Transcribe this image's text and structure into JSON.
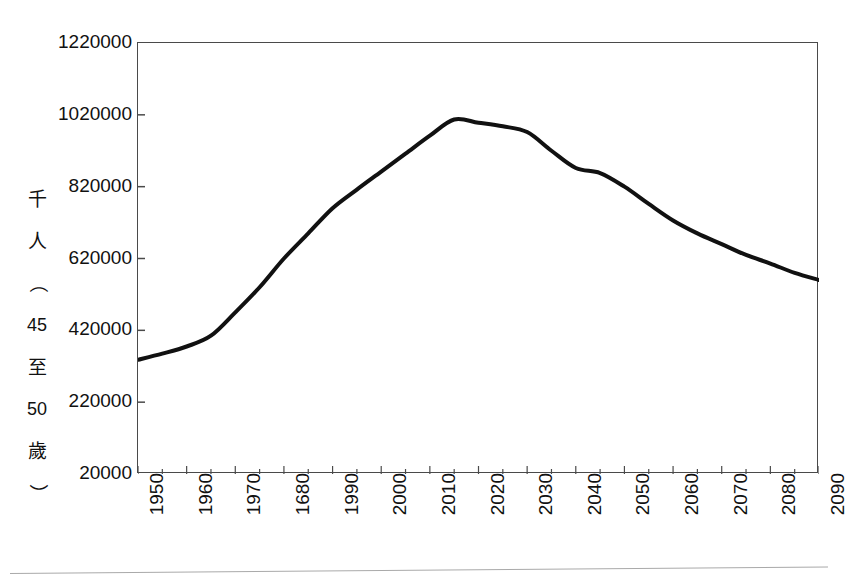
{
  "chart_data": {
    "type": "line",
    "title": "",
    "subtitle": "",
    "xlabel": "",
    "ylabel": "千人（45至50歲）",
    "ylabel_parts": [
      "千",
      "人",
      "（",
      "45",
      "至",
      "50",
      "歲",
      "）"
    ],
    "grid": false,
    "legend": "none",
    "line_color": "#111111",
    "line_width_px": 4,
    "frame_color": "#4a4a4a",
    "xlim": [
      1950,
      2090
    ],
    "ylim": [
      20000,
      1220000
    ],
    "y_ticks": [
      20000,
      220000,
      420000,
      620000,
      820000,
      1020000,
      1220000
    ],
    "y_tick_labels": [
      "20000",
      "220000",
      "420000",
      "620000",
      "820000",
      "1020000",
      "1220000"
    ],
    "x_ticks": [
      1950,
      1960,
      1970,
      1980,
      1990,
      2000,
      2010,
      2020,
      2030,
      2040,
      2050,
      2060,
      2070,
      2080,
      2090
    ],
    "x_tick_labels": [
      "1950",
      "1960",
      "1970",
      "1680",
      "1990",
      "2000",
      "2010",
      "2020",
      "2030",
      "2040",
      "2050",
      "2060",
      "2070",
      "2080",
      "2090"
    ],
    "x_minor_tick_interval": 5,
    "series": [
      {
        "name": "45至50歲人口",
        "x": [
          1950,
          1955,
          1960,
          1965,
          1970,
          1975,
          1980,
          1985,
          1990,
          1995,
          2000,
          2005,
          2010,
          2015,
          2020,
          2025,
          2030,
          2035,
          2040,
          2045,
          2050,
          2055,
          2060,
          2065,
          2070,
          2075,
          2080,
          2085,
          2090
        ],
        "values": [
          338000,
          355000,
          375000,
          405000,
          470000,
          540000,
          620000,
          690000,
          760000,
          812000,
          862000,
          912000,
          962000,
          1007000,
          998000,
          988000,
          972000,
          920000,
          872000,
          858000,
          820000,
          772000,
          726000,
          690000,
          660000,
          630000,
          606000,
          580000,
          560000
        ]
      }
    ]
  },
  "figure": {
    "y_axis_title": "千人（45至50歲）"
  }
}
